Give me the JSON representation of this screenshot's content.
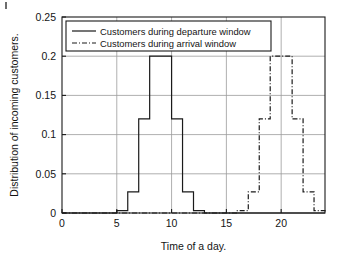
{
  "chart_data": {
    "type": "line",
    "title": "",
    "xlabel": "Time of a day.",
    "ylabel": "Distribution of incoming customers.",
    "xlim": [
      0,
      24
    ],
    "ylim": [
      0,
      0.25
    ],
    "xticks": [
      0,
      5,
      10,
      15,
      20
    ],
    "xtick_labels": [
      "0",
      "5",
      "10",
      "15",
      "20"
    ],
    "yticks": [
      0,
      0.05,
      0.1,
      0.15,
      0.2,
      0.25
    ],
    "ytick_labels": [
      "0",
      "0.05",
      "0.1",
      "0.15",
      "0.2",
      "0.25"
    ],
    "grid": true,
    "legend_position": "upper center",
    "drawstyle": "steps-post",
    "series": [
      {
        "name": "Customers during departure window",
        "linestyle": "solid",
        "color": "#1a1a1a",
        "x": [
          0,
          1,
          2,
          3,
          4,
          5,
          6,
          7,
          8,
          9,
          10,
          11,
          12,
          13,
          14,
          15,
          16,
          17,
          18,
          19,
          20,
          21,
          22,
          23,
          24
        ],
        "values": [
          0,
          0,
          0,
          0,
          0,
          0.003,
          0.027,
          0.12,
          0.2,
          0.2,
          0.12,
          0.027,
          0.003,
          0,
          0,
          0,
          0,
          0,
          0,
          0,
          0,
          0,
          0,
          0,
          0
        ]
      },
      {
        "name": "Customers during arrival window",
        "linestyle": "dashdot",
        "color": "#1a1a1a",
        "x": [
          0,
          1,
          2,
          3,
          4,
          5,
          6,
          7,
          8,
          9,
          10,
          11,
          12,
          13,
          14,
          15,
          16,
          17,
          18,
          19,
          20,
          21,
          22,
          23,
          24
        ],
        "values": [
          0,
          0,
          0,
          0,
          0,
          0,
          0,
          0,
          0,
          0,
          0,
          0,
          0,
          0,
          0,
          0,
          0.003,
          0.027,
          0.12,
          0.2,
          0.2,
          0.12,
          0.027,
          0.003,
          0
        ]
      }
    ]
  },
  "legend": {
    "entries": [
      {
        "label": "Customers during departure window",
        "style": "solid"
      },
      {
        "label": "Customers during arrival window",
        "style": "dashdot"
      }
    ]
  },
  "colors": {
    "line": "#1a1a1a",
    "grid": "#9a9a9a",
    "axis": "#1a1a1a",
    "background": "#ffffff"
  }
}
